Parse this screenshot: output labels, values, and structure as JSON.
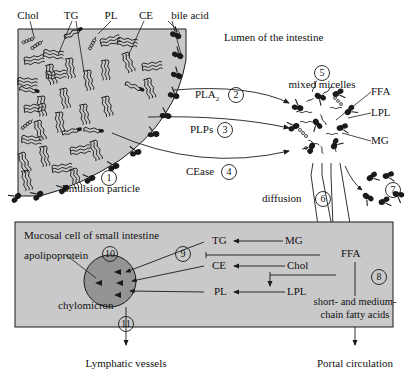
{
  "diagram": {
    "colors": {
      "emulsion_fill": "#c9c9c9",
      "cell_fill": "#c9c9c9",
      "chylomicron_fill": "#949494",
      "stroke": "#1a1a1a",
      "background": "#ffffff"
    }
  },
  "lumen": {
    "region_label": "Lumen of the intestine",
    "top_labels": [
      {
        "text": "Chol",
        "name": "label-chol"
      },
      {
        "text": "TG",
        "name": "label-tg"
      },
      {
        "text": "PL",
        "name": "label-pl"
      },
      {
        "text": "CE",
        "name": "label-ce"
      },
      {
        "text": "bile acid",
        "name": "label-bile-acid"
      }
    ],
    "emulsion_particle": {
      "label": "Emulsion particle",
      "step": "1"
    },
    "enzymes": [
      {
        "name": "PLA",
        "subscript": "2",
        "step": "2"
      },
      {
        "name": "PLPs",
        "subscript": "",
        "step": "3"
      },
      {
        "name": "CEase",
        "subscript": "",
        "step": "4"
      }
    ],
    "micelle": {
      "label": "mixed micelles",
      "step": "5",
      "products": [
        {
          "text": "FFA",
          "name": "micelle-label-ffa"
        },
        {
          "text": "LPL",
          "name": "micelle-label-lpl"
        },
        {
          "text": "MG",
          "name": "micelle-label-mg"
        }
      ]
    },
    "diffusion": {
      "label": "diffusion",
      "step": "6"
    },
    "free_bile_acid": {
      "step": "7"
    }
  },
  "mucosal_cell": {
    "region_label": "Mucosal cell of small intestine",
    "apolipoprotein_label": "apolipoprotein",
    "chylomicron_label": "chylomicron",
    "chylomicron_step": "10",
    "resynthesis_step": "9",
    "reactions": [
      {
        "product": "TG",
        "substrate": "MG",
        "name": "reaction-mg-to-tg"
      },
      {
        "product": "CE",
        "substrate": "Chol",
        "name": "reaction-chol-to-ce"
      },
      {
        "product": "PL",
        "substrate": "LPL",
        "name": "reaction-lpl-to-pl"
      }
    ],
    "ffa_label": "FFA",
    "short_chain": {
      "line1": "short- and medium-",
      "line2": "chain fatty acids",
      "step": "8"
    },
    "lymph_step": "11"
  },
  "outputs": [
    {
      "text": "Lymphatic vessels",
      "name": "output-lymphatic-vessels"
    },
    {
      "text": "Portal circulation",
      "name": "output-portal-circulation"
    }
  ]
}
